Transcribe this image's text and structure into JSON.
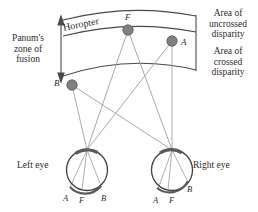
{
  "figure": {
    "type": "diagram"
  },
  "labels": {
    "panum": "Panum's\nzone of\nfusion",
    "horopter": "Horopter",
    "uncrossed": "Area of\nuncrossed\ndisparity",
    "crossed": "Area of\ncrossed\ndisparity",
    "left_eye": "Left eye",
    "right_eye": "Right eye"
  },
  "points": {
    "F": {
      "label": "F",
      "x": 128,
      "y": 30
    },
    "A": {
      "label": "A",
      "x": 172,
      "y": 41
    },
    "B": {
      "label": "B",
      "x": 72,
      "y": 85
    }
  },
  "retinal_labels": {
    "left_eye": [
      {
        "label": "A",
        "x": 63,
        "y": 194
      },
      {
        "label": "F",
        "x": 79,
        "y": 196
      },
      {
        "label": "B",
        "x": 101,
        "y": 194
      }
    ],
    "right_eye": [
      {
        "label": "A",
        "x": 153,
        "y": 196
      },
      {
        "label": "F",
        "x": 169,
        "y": 196
      },
      {
        "label": "B",
        "x": 187,
        "y": 185
      }
    ]
  },
  "colors": {
    "line": "#4a4a4a",
    "ray": "#9a9a9a",
    "point_fill": "#808080",
    "point_stroke": "#555555",
    "text": "#2b2b2b",
    "background": "#ffffff"
  }
}
